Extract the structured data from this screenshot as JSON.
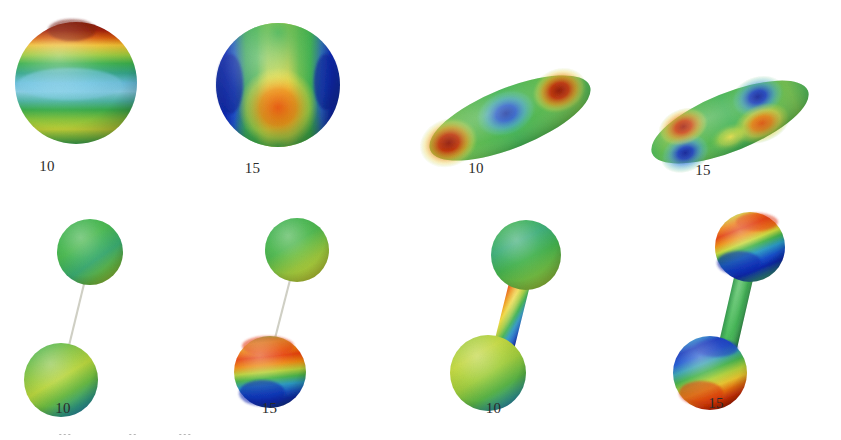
{
  "figure": {
    "width": 841,
    "height": 440,
    "background": "#ffffff",
    "colormap": "jet",
    "colormap_stops": [
      "#00007f",
      "#0000ff",
      "#007fff",
      "#00ffff",
      "#7fff7f",
      "#ffff00",
      "#ff7f00",
      "#ff0000",
      "#7f0000"
    ],
    "label_color": "#2b2b2b",
    "rows": 2,
    "columns": 4
  },
  "panels": [
    {
      "id": "panel-1",
      "row": 0,
      "column": 0,
      "label": "10",
      "geometry": "sphere",
      "bodies": 1,
      "mode_pattern": "zonal-bands",
      "description": "Sphere with horizontal latitude bands: dark red polar cap at top, yellow-green band, cyan-blue equatorial band, yellow-green band below",
      "lobe_colors": [
        "#8f1400",
        "#ffd400",
        "#3dbf4a",
        "#6fc8e8",
        "#a8d93c",
        "#34a84b"
      ]
    },
    {
      "id": "panel-2",
      "row": 0,
      "column": 1,
      "label": "15",
      "geometry": "sphere",
      "bodies": 1,
      "mode_pattern": "sectoral-lobes",
      "description": "Sphere with vertical lobes: deep blue lobes at left and right limbs, broad yellow band with a red-orange core at centre",
      "lobe_colors": [
        "#0b1a9e",
        "#1a2fd0",
        "#3fbf55",
        "#f2e24a",
        "#f06010",
        "#e03a0a"
      ]
    },
    {
      "id": "panel-3",
      "row": 0,
      "column": 2,
      "label": "10",
      "geometry": "prolate-ellipsoid",
      "bodies": 1,
      "tilt_deg": -22,
      "mode_pattern": "axial-three-lobe",
      "description": "Tilted prolate ellipsoid: dark red lobe at lower-left end, blue depression in the middle, dark red lobe at upper-right end with yellow fringes",
      "lobe_colors": [
        "#9b1500",
        "#2f7fd8",
        "#1b3fc0",
        "#f2e44a",
        "#a81300",
        "#3db050"
      ]
    },
    {
      "id": "panel-4",
      "row": 0,
      "column": 3,
      "label": "15",
      "geometry": "prolate-ellipsoid",
      "bodies": 1,
      "tilt_deg": -22,
      "mode_pattern": "quadrupolar",
      "description": "Tilted prolate ellipsoid with four alternating lobes: blue lower-left, dark red upper-left, deep blue upper-right, orange-red lower-right",
      "lobe_colors": [
        "#1630bd",
        "#a81300",
        "#101f9e",
        "#e2540a",
        "#f0e04a",
        "#3db050"
      ]
    },
    {
      "id": "panel-5",
      "row": 1,
      "column": 0,
      "label": "10",
      "geometry": "diatomic-dumbbell",
      "bodies": 2,
      "bond_style": "thin-line",
      "bond_color": "#cfcfc4",
      "mode_pattern": "low-amplitude",
      "description": "Two well-separated spheres joined by a hairline bond; both spheres nearly uniform green with faint yellow-green and teal shading",
      "lobe_colors": [
        "#3eb64f",
        "#79c83e",
        "#a8d43a",
        "#36a9a0",
        "#4cba57"
      ]
    },
    {
      "id": "panel-6",
      "row": 1,
      "column": 1,
      "label": "15",
      "geometry": "diatomic-dumbbell",
      "bodies": 2,
      "bond_style": "thin-line",
      "bond_color": "#cfcfc4",
      "mode_pattern": "localized-on-lower-sphere",
      "description": "Two spheres joined by a hairline bond; upper sphere mostly green with yellow-green patch, lower sphere shows a red-orange cap over a deep blue basin",
      "lobe_colors": [
        "#45b550",
        "#b9d83a",
        "#e8400a",
        "#f2a000",
        "#0f2fb8",
        "#1f86d8"
      ]
    },
    {
      "id": "panel-7",
      "row": 1,
      "column": 2,
      "label": "10",
      "geometry": "diatomic-dumbbell",
      "bodies": 2,
      "bond_style": "thick-cylinder",
      "bond_color": "rainbow-gradient",
      "mode_pattern": "bond-stretch",
      "description": "Two spheres joined by a thick cylindrical bond carrying a full rainbow gradient from red at the top end through yellow and green to deep blue at the bottom end; spheres mostly green and yellow-green",
      "lobe_colors": [
        "#ea3a08",
        "#f2d23a",
        "#3eb64f",
        "#1f86d8",
        "#10229e",
        "#9ad23c"
      ]
    },
    {
      "id": "panel-8",
      "row": 1,
      "column": 3,
      "label": "15",
      "geometry": "diatomic-dumbbell",
      "bodies": 2,
      "bond_style": "thick-cylinder",
      "bond_color": "#3cb24e",
      "mode_pattern": "antisymmetric-rotation",
      "description": "Two spheres joined by a uniform green cylindrical bond; upper sphere has a red-orange cap over a deep blue basin, lower sphere is the mirror image with a blue cap over a red-orange basin",
      "lobe_colors": [
        "#e8400a",
        "#f2a000",
        "#0f2fb8",
        "#1f86d8",
        "#3cb24e"
      ]
    }
  ],
  "clipped_bottom_text": {
    "visible": true,
    "note": "row of partially cropped glyph tops along the very bottom edge of the image"
  }
}
